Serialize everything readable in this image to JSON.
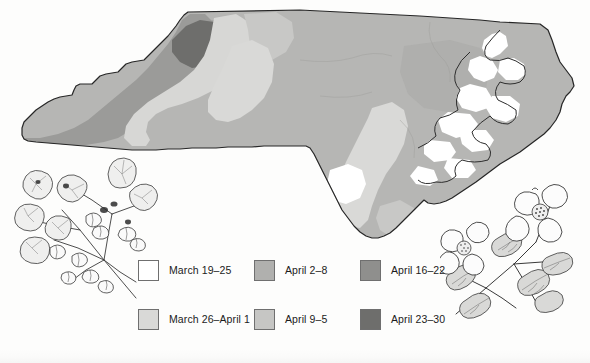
{
  "figure": {
    "region": "North Carolina"
  },
  "map": {
    "name": "north-carolina-bloom-dates",
    "outline_color": "#2a2a2a",
    "zone_colors": {
      "march_19_25": "#ffffff",
      "march_26_april_1": "#dcdcda",
      "april_2_8": "#b9b9b7",
      "april_9_5": "#c9c9c7",
      "april_16_22": "#9a9a98",
      "april_23_30": "#6e6e6c"
    }
  },
  "legend": {
    "name": "bloom-date-legend",
    "items": [
      {
        "label": "March 19–25",
        "color": "#ffffff",
        "key": "march_19_25"
      },
      {
        "label": "April 2–8",
        "color": "#b0b0ae",
        "key": "april_2_8"
      },
      {
        "label": "April 16–22",
        "color": "#8f8f8d",
        "key": "april_16_22"
      },
      {
        "label": "March 26–April 1",
        "color": "#d9d9d7",
        "key": "march_26_april_1"
      },
      {
        "label": "April 9–5",
        "color": "#c6c6c4",
        "key": "april_9_5"
      },
      {
        "label": "April 23–30",
        "color": "#6e6e6c",
        "key": "april_23_30"
      }
    ]
  },
  "illustrations": [
    {
      "name": "redbud-illustration",
      "subject": "Eastern redbud branch with heart-shaped leaves and blossoms",
      "position": "lower-left"
    },
    {
      "name": "dogwood-illustration",
      "subject": "Flowering dogwood branch with two four-petal blooms",
      "position": "lower-right"
    }
  ]
}
